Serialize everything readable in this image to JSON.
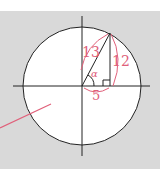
{
  "diagram": {
    "type": "unit-circle-triangle",
    "colors": {
      "background_top": "#ffffff",
      "background": "#d9d9d9",
      "circle_fill": "#ffffff",
      "stroke": "#222222",
      "accent": "#e0607a"
    },
    "labels": {
      "hypotenuse": "13",
      "opposite": "12",
      "adjacent": "5",
      "angle": "α"
    }
  }
}
